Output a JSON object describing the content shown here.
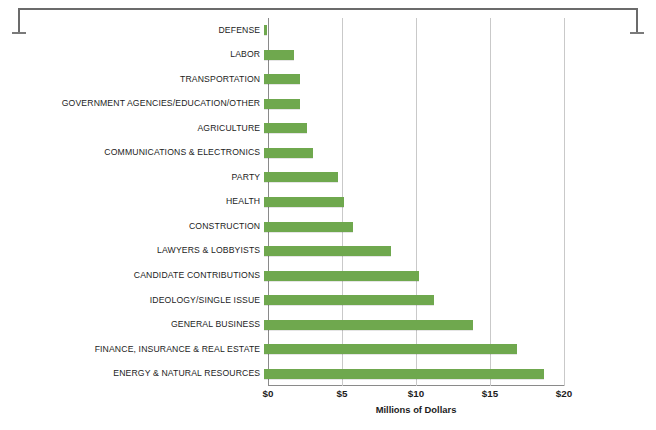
{
  "chart_data": {
    "type": "bar",
    "orientation": "horizontal",
    "title": "",
    "subtitle": "",
    "xlabel": "Millions of Dollars",
    "ylabel": "",
    "xlim": [
      0,
      20
    ],
    "xticks": [
      0,
      5,
      10,
      15,
      20
    ],
    "xtick_labels": [
      "$0",
      "$5",
      "$10",
      "$15",
      "$20"
    ],
    "grid": "vertical",
    "legend": "none",
    "bar_color": "#6fa84e",
    "gridline_color": "#c9c9c9",
    "axis_color": "#8a8a8a",
    "units": "millions of dollars",
    "categories": [
      "DEFENSE",
      "LABOR",
      "TRANSPORTATION",
      "GOVERNMENT AGENCIES/EDUCATION/OTHER",
      "AGRICULTURE",
      "COMMUNICATIONS & ELECTRONICS",
      "PARTY",
      "HEALTH",
      "CONSTRUCTION",
      "LAWYERS & LOBBYISTS",
      "CANDIDATE CONTRIBUTIONS",
      "IDEOLOGY/SINGLE ISSUE",
      "GENERAL BUSINESS",
      "FINANCE, INSURANCE & REAL ESTATE",
      "ENERGY & NATURAL RESOURCES"
    ],
    "values": [
      0.2,
      2.0,
      2.4,
      2.4,
      2.9,
      3.3,
      5.0,
      5.4,
      6.0,
      8.6,
      10.5,
      11.5,
      14.1,
      17.1,
      18.9
    ]
  },
  "decor": {
    "bracket_name": "top-bracket"
  }
}
